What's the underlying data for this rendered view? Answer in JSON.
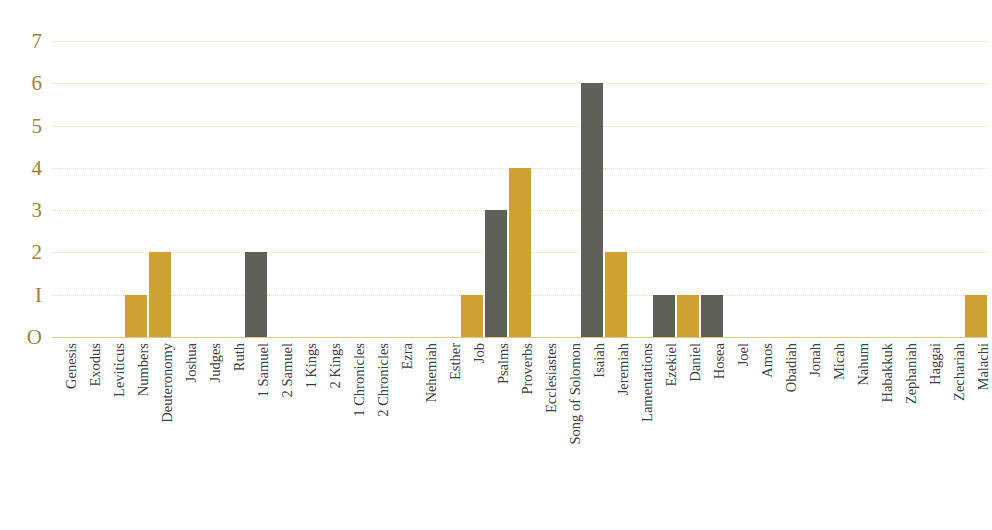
{
  "title": {
    "text": "",
    "visible_fragment": true
  },
  "axes": {
    "y_tick_labels": [
      "7",
      "6",
      "5",
      "4",
      "3",
      "2",
      "I",
      "O"
    ],
    "y_tick_values": [
      7,
      6,
      5,
      4,
      3,
      2,
      1,
      0
    ],
    "xlabel": "",
    "ylabel": ""
  },
  "colors": {
    "bar_gray": "#5f6158",
    "bar_gold": "#cfa233",
    "gridline": "#f0e2ae",
    "baseline": "#ddc98a",
    "y_tick_text": "#9c8433",
    "x_tick_text": "#3e3e42",
    "background": "#ffffff"
  },
  "chart_data": {
    "type": "bar",
    "title": "",
    "xlabel": "",
    "ylabel": "",
    "ylim": [
      0,
      7
    ],
    "grid": true,
    "legend": "none",
    "categories": [
      "Genesis",
      "Exodus",
      "Leviticus",
      "Numbers",
      "Deuteronomy",
      "Joshua",
      "Judges",
      "Ruth",
      "1 Samuel",
      "2 Samuel",
      "1 Kings",
      "2 Kings",
      "1 Chronicles",
      "2 Chronicles",
      "Ezra",
      "Nehemiah",
      "Esther",
      "Job",
      "Psalms",
      "Proverbs",
      "Ecclesiastes",
      "Song of Solomon",
      "Isaiah",
      "Jeremiah",
      "Lamentations",
      "Ezekiel",
      "Daniel",
      "Hosea",
      "Joel",
      "Amos",
      "Obadiah",
      "Jonah",
      "Micah",
      "Nahum",
      "Habakkuk",
      "Zephaniah",
      "Haggai",
      "Zechariah",
      "Malachi"
    ],
    "values": [
      0,
      0,
      0,
      1,
      2,
      0,
      0,
      0,
      2,
      0,
      0,
      0,
      0,
      0,
      0,
      0,
      0,
      1,
      3,
      4,
      0,
      0,
      6,
      2,
      0,
      1,
      1,
      1,
      0,
      0,
      0,
      0,
      0,
      0,
      0,
      0,
      0,
      0,
      1
    ],
    "bar_colors": [
      "gray",
      "gold",
      "gray",
      "gold",
      "gold",
      "gray",
      "gold",
      "gray",
      "gray",
      "gold",
      "gray",
      "gold",
      "gray",
      "gold",
      "gray",
      "gold",
      "gray",
      "gold",
      "gray",
      "gold",
      "gray",
      "gold",
      "gray",
      "gold",
      "gray",
      "gray",
      "gold",
      "gray",
      "gold",
      "gray",
      "gold",
      "gray",
      "gold",
      "gray",
      "gold",
      "gray",
      "gold",
      "gray",
      "gold"
    ],
    "nonzero_points": [
      {
        "category": "Numbers",
        "value": 1,
        "color": "gray"
      },
      {
        "category": "Deuteronomy",
        "value": 2,
        "color": "gold"
      },
      {
        "category": "1 Samuel",
        "value": 2,
        "color": "gray"
      },
      {
        "category": "Job",
        "value": 1,
        "color": "gold"
      },
      {
        "category": "Psalms",
        "value": 3,
        "color": "gray"
      },
      {
        "category": "Proverbs",
        "value": 4,
        "color": "gold"
      },
      {
        "category": "Isaiah",
        "value": 6,
        "color": "gray"
      },
      {
        "category": "Jeremiah",
        "value": 2,
        "color": "gold"
      },
      {
        "category": "Ezekiel",
        "value": 1,
        "color": "gray"
      },
      {
        "category": "Daniel",
        "value": 1,
        "color": "gold"
      },
      {
        "category": "Hosea",
        "value": 1,
        "color": "gray"
      },
      {
        "category": "Malachi",
        "value": 1,
        "color": "gold"
      }
    ]
  }
}
